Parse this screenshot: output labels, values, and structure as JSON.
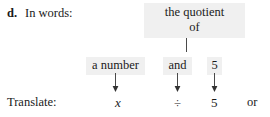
{
  "exercise": {
    "item_label": "d.",
    "in_words_label": "In words:",
    "translate_label": "Translate:"
  },
  "phrases": {
    "quotient_line1": "the quotient",
    "quotient_line2": "of",
    "operand_left": "a number",
    "conjunction": "and",
    "operand_right": "5"
  },
  "translation": {
    "variable": "x",
    "operator": "÷",
    "number": "5",
    "alternative_connector": "or"
  },
  "icons": {
    "arrow_down": "arrow-down-icon",
    "connector": "vertical-connector-line"
  },
  "colors": {
    "highlight_background": "#f0f0f0",
    "text": "#1a1a1a",
    "page_background": "#ffffff",
    "rule": "#4a4a4a"
  }
}
